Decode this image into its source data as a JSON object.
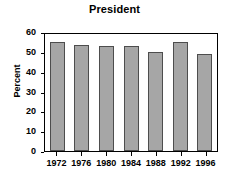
{
  "chart_data": {
    "type": "bar",
    "title": "President",
    "xlabel": "",
    "ylabel": "Percent",
    "categories": [
      "1972",
      "1976",
      "1980",
      "1984",
      "1988",
      "1992",
      "1996"
    ],
    "values": [
      55.2,
      53.6,
      52.8,
      53.1,
      50.1,
      55.2,
      49.0
    ],
    "ylim": [
      0,
      60
    ],
    "ytick_values": [
      60,
      50,
      40,
      30,
      20,
      10,
      0
    ],
    "ytick_labels": [
      "60",
      "50",
      "40",
      "30",
      "20",
      "10",
      "0"
    ],
    "grid": false,
    "legend": null,
    "bar_color": "#a6a6a6",
    "bar_border_color": "#4d4d4d",
    "axis_color": "#000000",
    "background_color": "#ffffff"
  }
}
